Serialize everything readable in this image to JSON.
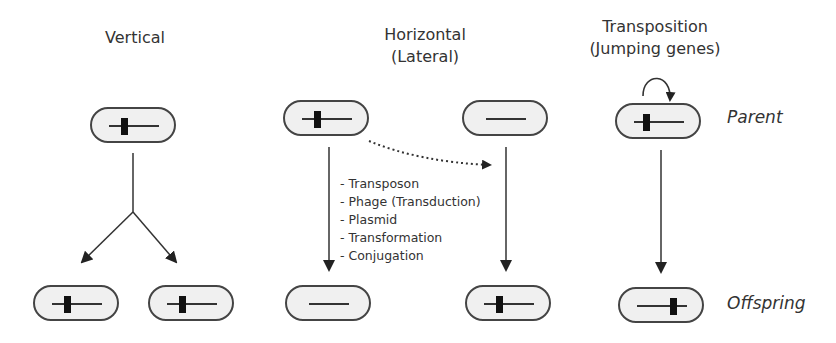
{
  "panels": {
    "vertical": {
      "title": "Vertical"
    },
    "horizontal": {
      "title_line1": "Horizontal",
      "title_line2": "(Lateral)",
      "mechanisms": [
        "- Transposon",
        "- Phage (Transduction)",
        "- Plasmid",
        "- Transformation",
        "- Conjugation"
      ]
    },
    "transposition": {
      "title_line1": "Transposition",
      "title_line2": "(Jumping genes)",
      "parent_label": "Parent",
      "offspring_label": "Offspring"
    }
  },
  "colors": {
    "cell_fill": "#f0f0f0",
    "cell_border": "#444444",
    "transposon": "#111111",
    "arrow": "#333333"
  }
}
